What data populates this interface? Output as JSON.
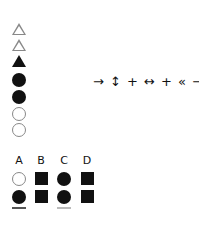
{
  "shape_column": [
    {
      "shape": "triangle-outline"
    },
    {
      "shape": "triangle-outline"
    },
    {
      "shape": "triangle-filled"
    },
    {
      "shape": "circle-filled"
    },
    {
      "shape": "circle-filled"
    },
    {
      "shape": "circle-outline"
    },
    {
      "shape": "circle-outline"
    }
  ],
  "symbol_sequence": {
    "text": "→ ↕ + ↔ + « →",
    "items": [
      "→",
      "↕",
      "+",
      "↔",
      "+",
      "«",
      "→"
    ]
  },
  "grid": {
    "headers": [
      "A",
      "B",
      "C",
      "D"
    ],
    "rows": [
      [
        "circle-outline",
        "square-filled",
        "circle-filled",
        "square-filled"
      ],
      [
        "circle-filled",
        "square-filled",
        "circle-filled",
        "square-filled"
      ]
    ]
  },
  "colors": {
    "filled": "#111111",
    "outline": "#888888",
    "background": "#ffffff"
  }
}
